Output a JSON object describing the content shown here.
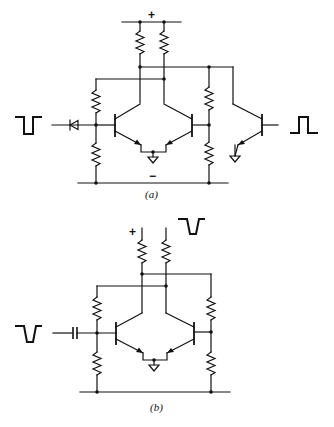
{
  "figure": {
    "panels": [
      {
        "id": "a",
        "caption": "(a)",
        "supply_positive_label": "+",
        "supply_negative_label": "−",
        "input_waveform": "negative-going-pulse",
        "input_coupling": "diode",
        "output_waveform": "positive-going-pulse",
        "transistors": 3,
        "resistors": 6
      },
      {
        "id": "b",
        "caption": "(b)",
        "supply_positive_label": "+",
        "input_waveform": "negative-going-pulse",
        "input_coupling": "capacitor",
        "output_waveform": "negative-going-pulse",
        "transistors": 2,
        "resistors": 6
      }
    ]
  },
  "colors": {
    "ink": "#111111",
    "background": "#ffffff"
  }
}
